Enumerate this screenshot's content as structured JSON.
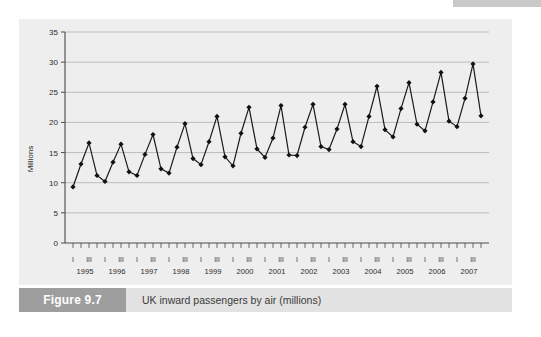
{
  "figure": {
    "tag": "Figure 9.7",
    "caption": "UK inward passengers by air (millions)"
  },
  "chart_data": {
    "type": "line",
    "title": "UK inward passengers by air (millions)",
    "xlabel": "",
    "ylabel": "Millions",
    "ylim": [
      0,
      35
    ],
    "ytick_step": 5,
    "yticks": [
      "0",
      "5",
      "10",
      "15",
      "20",
      "25",
      "30",
      "35"
    ],
    "grid": true,
    "legend": "none",
    "marker": "diamond",
    "line_color": "#1a1a1a",
    "panel_color": "#eeeeee",
    "grid_color": "#9a9a9a",
    "years": [
      "1995",
      "1996",
      "1997",
      "1998",
      "1999",
      "2000",
      "2001",
      "2002",
      "2003",
      "2004",
      "2005",
      "2006",
      "2007"
    ],
    "quarter_labels": [
      "I",
      "III"
    ],
    "x": [
      "1995 Q1",
      "1995 Q2",
      "1995 Q3",
      "1995 Q4",
      "1996 Q1",
      "1996 Q2",
      "1996 Q3",
      "1996 Q4",
      "1997 Q1",
      "1997 Q2",
      "1997 Q3",
      "1997 Q4",
      "1998 Q1",
      "1998 Q2",
      "1998 Q3",
      "1998 Q4",
      "1999 Q1",
      "1999 Q2",
      "1999 Q3",
      "1999 Q4",
      "2000 Q1",
      "2000 Q2",
      "2000 Q3",
      "2000 Q4",
      "2001 Q1",
      "2001 Q2",
      "2001 Q3",
      "2001 Q4",
      "2002 Q1",
      "2002 Q2",
      "2002 Q3",
      "2002 Q4",
      "2003 Q1",
      "2003 Q2",
      "2003 Q3",
      "2003 Q4",
      "2004 Q1",
      "2004 Q2",
      "2004 Q3",
      "2004 Q4",
      "2005 Q1",
      "2005 Q2",
      "2005 Q3",
      "2005 Q4",
      "2006 Q1",
      "2006 Q2",
      "2006 Q3",
      "2006 Q4",
      "2007 Q1",
      "2007 Q2",
      "2007 Q3",
      "2007 Q4"
    ],
    "values": [
      9.3,
      13.1,
      16.6,
      11.2,
      10.2,
      13.4,
      16.4,
      11.8,
      11.2,
      14.7,
      18.0,
      12.3,
      11.6,
      15.9,
      19.8,
      14.0,
      13.0,
      16.8,
      21.0,
      14.3,
      12.8,
      18.2,
      22.5,
      15.6,
      14.2,
      17.4,
      22.8,
      14.6,
      14.5,
      19.2,
      23.0,
      16.0,
      15.5,
      18.9,
      23.0,
      16.8,
      16.0,
      21.0,
      26.0,
      18.8,
      17.6,
      22.3,
      26.6,
      19.7,
      18.6,
      23.4,
      28.3,
      20.2,
      19.3,
      24.0,
      29.7,
      21.1
    ]
  }
}
